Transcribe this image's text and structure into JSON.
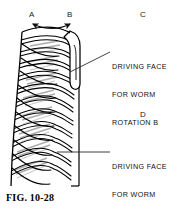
{
  "figure": {
    "caption": "FIG. 10-28",
    "labels": {
      "a": "A",
      "b": "B",
      "c": "C",
      "d": "D"
    },
    "callouts": [
      {
        "id": "driving-face-rotation-b",
        "line1": "DRIVING FACE",
        "line2": "FOR WORM",
        "line3": "ROTATION B"
      },
      {
        "id": "driving-face-rotation-a",
        "line1": "DRIVING FACE",
        "line2": "FOR WORM",
        "line3": "ROTATION A"
      }
    ],
    "colors": {
      "ink": "#000000",
      "shading": "#9a9a9a",
      "leader": "#2b2b2b",
      "background": "#ffffff"
    }
  }
}
